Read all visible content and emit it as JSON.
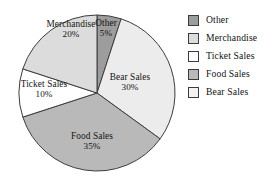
{
  "chart_data": {
    "type": "pie",
    "title": "",
    "categories": [
      "Other",
      "Merchandise",
      "Ticket Sales",
      "Food Sales",
      "Bear Sales"
    ],
    "values": [
      5,
      20,
      10,
      35,
      30
    ],
    "unit": "%",
    "legend_position": "right",
    "grid": false,
    "slices": [
      {
        "name": "Other",
        "label": "Other",
        "value": 5,
        "value_label": "5%",
        "color": "#9d9d9d",
        "start_angle": 0,
        "end_angle": 18,
        "label_x": 106,
        "label_y": 28
      },
      {
        "name": "Bear Sales",
        "label": "Bear Sales",
        "value": 30,
        "value_label": "30%",
        "color": "#ececec",
        "start_angle": 18,
        "end_angle": 126,
        "label_x": 130,
        "label_y": 82
      },
      {
        "name": "Food Sales",
        "label": "Food Sales",
        "value": 35,
        "value_label": "35%",
        "color": "#b9b9b9",
        "start_angle": 126,
        "end_angle": 252,
        "label_x": 92,
        "label_y": 141
      },
      {
        "name": "Ticket Sales",
        "label": "Ticket Sales",
        "value": 10,
        "value_label": "10%",
        "color": "#ffffff",
        "start_angle": 252,
        "end_angle": 288,
        "label_x": 44,
        "label_y": 89
      },
      {
        "name": "Merchandise",
        "label": "Merchandise",
        "value": 20,
        "value_label": "20%",
        "color": "#dcdcdc",
        "start_angle": 288,
        "end_angle": 360,
        "label_x": 71,
        "label_y": 29
      }
    ],
    "legend": [
      {
        "label": "Other",
        "color": "#9d9d9d"
      },
      {
        "label": "Merchandise",
        "color": "#dcdcdc"
      },
      {
        "label": "Ticket Sales",
        "color": "#ffffff"
      },
      {
        "label": "Food Sales",
        "color": "#b9b9b9"
      },
      {
        "label": "Bear Sales",
        "color": "#f2f2f2"
      }
    ],
    "geometry": {
      "center_x": 97,
      "center_y": 93,
      "radius": 78,
      "outline_color": "#3d3d3d"
    }
  }
}
